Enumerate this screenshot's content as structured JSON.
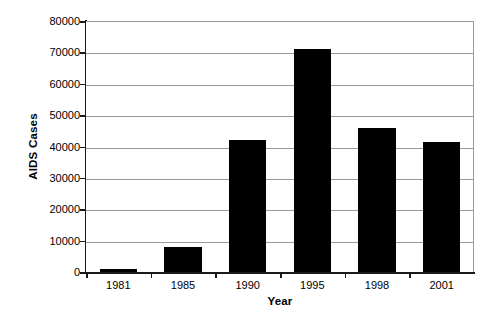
{
  "chart_data": {
    "type": "bar",
    "title": "",
    "subtitle": "",
    "xlabel": "Year",
    "ylabel": "AIDS Cases",
    "categories": [
      "1981",
      "1985",
      "1990",
      "1995",
      "1998",
      "2001"
    ],
    "values": [
      900,
      8000,
      42000,
      71000,
      46000,
      41500
    ],
    "series": [
      {
        "name": "AIDS Cases",
        "values": [
          900,
          8000,
          42000,
          71000,
          46000,
          41500
        ]
      }
    ],
    "ylim": [
      0,
      80000
    ],
    "ytick_step": 10000,
    "ytick_labels": [
      "0",
      "10000",
      "20000",
      "30000",
      "40000",
      "50000",
      "60000",
      "70000",
      "80000"
    ],
    "ytick_values": [
      0,
      10000,
      20000,
      30000,
      40000,
      50000,
      60000,
      70000,
      80000
    ],
    "xtick_labels": [
      "1981",
      "1985",
      "1990",
      "1995",
      "1998",
      "2001"
    ],
    "grid": true,
    "grid_axis": "y",
    "legend": false,
    "legend_position": "none",
    "bar_color": "#000000",
    "grid_color": "#9a9a9a",
    "axis_color": "#1a1a1a",
    "background_color": "#ffffff",
    "annotations": []
  }
}
